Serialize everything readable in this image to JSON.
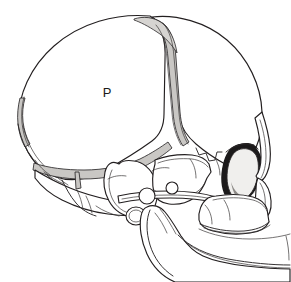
{
  "figure": {
    "kind": "anatomical-line-drawing",
    "view": "lateral (left side) view",
    "background_color": "#ffffff",
    "outline_color": "#231f20",
    "suture_fill_color": "#c9c7c4",
    "orbit_shadow_color": "#1c1a1b",
    "width_px": 291,
    "height_px": 282
  },
  "labels": [
    {
      "id": "parietal",
      "text": "P",
      "meaning": "parietal bone",
      "x": 107,
      "y": 93
    }
  ],
  "regions": [
    {
      "id": "parietal-bone",
      "name": "parietal bone",
      "label": "P"
    },
    {
      "id": "frontal-bone",
      "name": "frontal bone",
      "label": ""
    },
    {
      "id": "occipital-bone",
      "name": "occipital bone",
      "label": ""
    },
    {
      "id": "temporal-squama",
      "name": "squamous part of temporal bone",
      "label": ""
    },
    {
      "id": "sphenoid-greater-wing",
      "name": "greater wing of sphenoid",
      "label": ""
    },
    {
      "id": "orbit",
      "name": "orbit",
      "label": ""
    },
    {
      "id": "zygomatic-arch",
      "name": "zygomatic arch",
      "label": ""
    },
    {
      "id": "maxilla",
      "name": "maxilla",
      "label": ""
    },
    {
      "id": "mandible",
      "name": "mandible",
      "label": ""
    },
    {
      "id": "mastoid-process",
      "name": "mastoid region",
      "label": ""
    },
    {
      "id": "external-auditory-meatus",
      "name": "external auditory meatus",
      "label": ""
    },
    {
      "id": "coronal-suture",
      "name": "coronal suture",
      "label": ""
    },
    {
      "id": "squamous-suture",
      "name": "squamous suture",
      "label": ""
    },
    {
      "id": "occipitomastoid-suture",
      "name": "occipitomastoid suture",
      "label": ""
    }
  ]
}
